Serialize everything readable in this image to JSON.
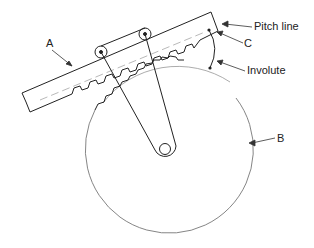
{
  "diagram": {
    "labels": {
      "a": "A",
      "b": "B",
      "c": "C",
      "pitch_line": "Pitch line",
      "involute": "Involute"
    },
    "colors": {
      "stroke": "#222222",
      "light_stroke": "#666666",
      "background": "#ffffff"
    }
  }
}
